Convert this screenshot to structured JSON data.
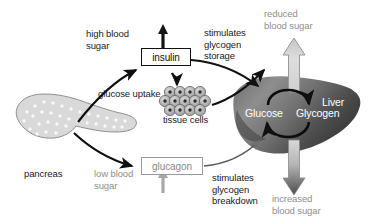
{
  "diagram": {
    "background_color": "#ffffff",
    "text_color_dark": "#1a1a1a",
    "text_color_gray": "#8e8e8e",
    "text_color_white": "#ffffff"
  },
  "labels": {
    "high_blood_sugar": "high blood\nsugar",
    "low_blood_sugar": "low blood\nsugar",
    "reduced_blood_sugar": "reduced\nblood sugar",
    "increased_blood_sugar": "increased\nblood sugar",
    "glucose_uptake": "glucose uptake",
    "tissue_cells": "tissue cells",
    "pancreas": "pancreas",
    "stimulates_glycogen_storage": "stimulates\nglycogen\nstorage",
    "stimulates_glycogen_breakdown": "stimulates\nglycogen\nbreakdown"
  },
  "hormones": {
    "insulin": "insulin",
    "glucagon": "glucagon"
  },
  "liver": {
    "name": "Liver",
    "glucose": "Glucose",
    "glycogen": "Glycogen"
  },
  "colors": {
    "insulin_box_border": "#101010",
    "glucagon_box_border": "#9a9a9a",
    "liver_dark": "#4a4a4a",
    "liver_light": "#d8d8d8",
    "pancreas_fill": "#d6d6d6",
    "cell_fill": "#b8b8b8",
    "arrow_black": "#101010",
    "arrow_gray": "#b0b0b0"
  }
}
